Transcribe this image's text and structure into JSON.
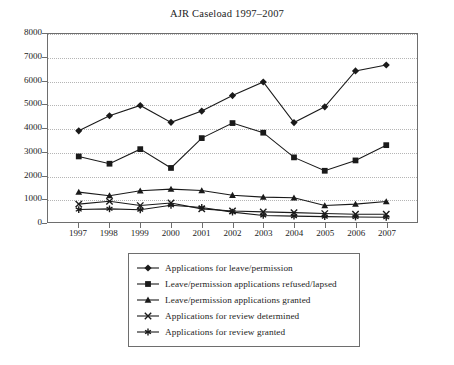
{
  "chart_data": {
    "type": "line",
    "title": "AJR Caseload 1997–2007",
    "xlabel": "",
    "ylabel": "",
    "categories": [
      "1997",
      "1998",
      "1999",
      "2000",
      "2001",
      "2002",
      "2003",
      "2004",
      "2005",
      "2006",
      "2007"
    ],
    "ylim": [
      0,
      8000
    ],
    "ytick_values": [
      0,
      1000,
      2000,
      3000,
      4000,
      5000,
      6000,
      7000,
      8000
    ],
    "ytick_labels": [
      "0",
      "1000",
      "2000",
      "3000",
      "4000",
      "5000",
      "6000",
      "7000",
      "8000"
    ],
    "grid": true,
    "legend_position": "below-plot",
    "series": [
      {
        "name": "Applications for leave/permission",
        "marker": "diamond",
        "color": "#1a1a1a",
        "values": [
          3880,
          4520,
          4960,
          4240,
          4720,
          5380,
          5960,
          4230,
          4900,
          6430,
          6680
        ]
      },
      {
        "name": "Leave/permission applications refused/lapsed",
        "marker": "square",
        "color": "#1a1a1a",
        "values": [
          2790,
          2480,
          3100,
          2300,
          3570,
          4210,
          3800,
          2750,
          2180,
          2620,
          3270
        ]
      },
      {
        "name": "Leave/permission applications granted",
        "marker": "triangle",
        "color": "#1a1a1a",
        "values": [
          1270,
          1120,
          1330,
          1400,
          1340,
          1140,
          1060,
          1030,
          700,
          760,
          870
        ]
      },
      {
        "name": "Applications for review determined",
        "marker": "cross",
        "color": "#1a1a1a",
        "values": [
          760,
          880,
          700,
          810,
          560,
          470,
          430,
          400,
          360,
          330,
          330
        ]
      },
      {
        "name": "Applications for review granted",
        "marker": "asterisk",
        "color": "#1a1a1a",
        "values": [
          530,
          560,
          520,
          710,
          620,
          420,
          280,
          250,
          230,
          210,
          200
        ]
      }
    ]
  },
  "legend": {
    "items": [
      {
        "label": "Applications for leave/permission",
        "marker": "diamond"
      },
      {
        "label": "Leave/permission applications refused/lapsed",
        "marker": "square"
      },
      {
        "label": "Leave/permission applications granted",
        "marker": "triangle"
      },
      {
        "label": "Applications for review determined",
        "marker": "cross"
      },
      {
        "label": "Applications for review granted",
        "marker": "asterisk"
      }
    ]
  },
  "colors": {
    "axis": "#6e6e6e",
    "grid": "#b5b5b5",
    "ink": "#1a1a1a",
    "background": "#ffffff"
  }
}
